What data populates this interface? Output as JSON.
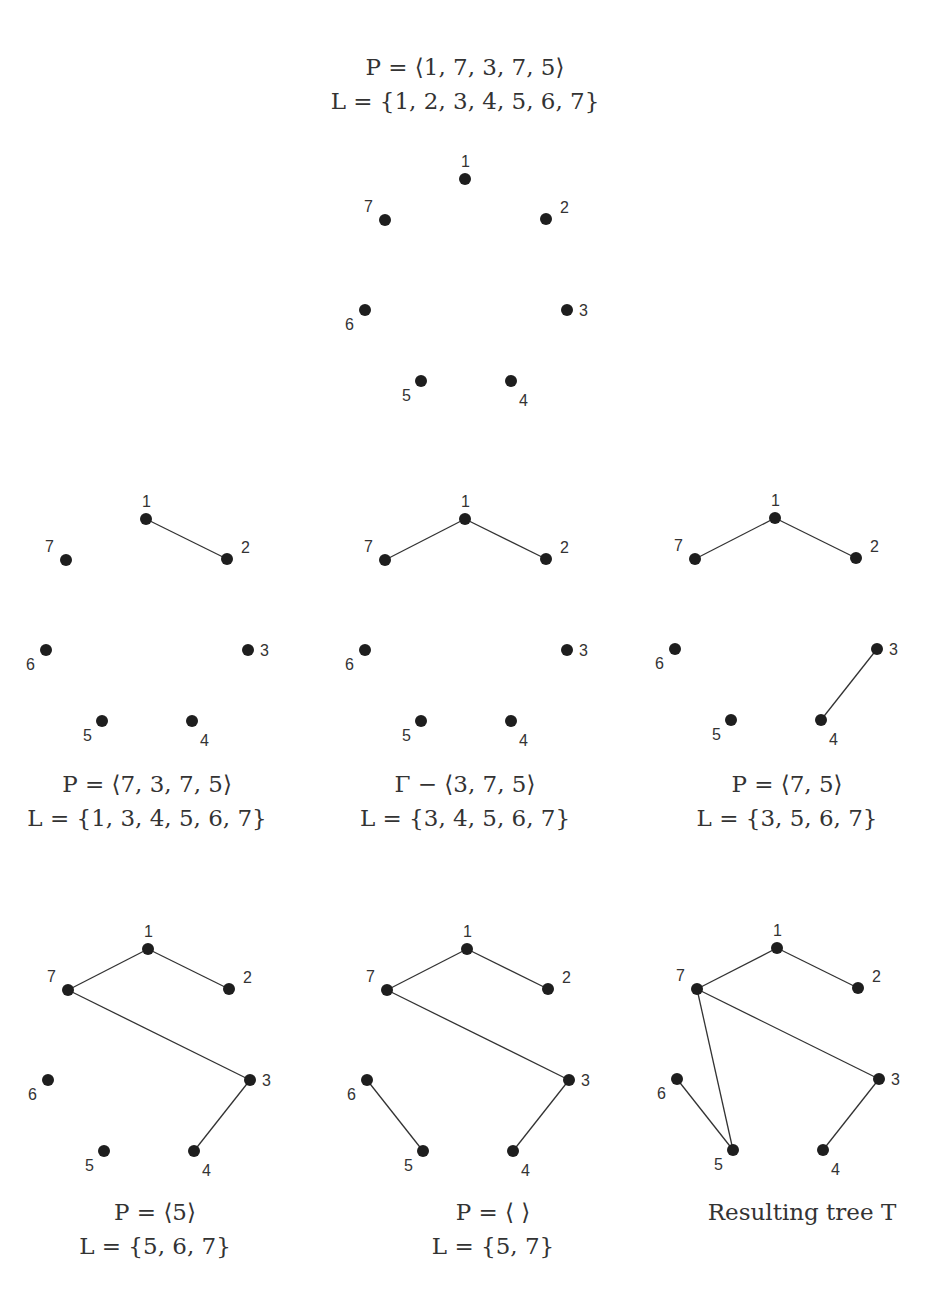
{
  "node_labels": [
    "1",
    "2",
    "3",
    "4",
    "5",
    "6",
    "7"
  ],
  "colors": {
    "node": "#1e1e1e",
    "edge": "#333333",
    "text": "#333333"
  },
  "panels": [
    {
      "id": "initial",
      "edges": [],
      "caption": {
        "line1": "P = ⟨1, 7, 3, 7, 5⟩",
        "line2": "L = {1, 2, 3, 4, 5, 6, 7}",
        "position": "above"
      }
    },
    {
      "id": "step1",
      "edges": [
        [
          1,
          2
        ]
      ],
      "caption": {
        "line1": "P = ⟨7, 3, 7, 5⟩",
        "line2": "L = {1, 3, 4, 5, 6, 7}",
        "position": "below"
      }
    },
    {
      "id": "step2",
      "edges": [
        [
          1,
          2
        ],
        [
          1,
          7
        ]
      ],
      "caption": {
        "line1": "Γ − ⟨3, 7, 5⟩",
        "line2": "L = {3, 4, 5, 6, 7}",
        "position": "below"
      }
    },
    {
      "id": "step3",
      "edges": [
        [
          1,
          2
        ],
        [
          1,
          7
        ],
        [
          3,
          4
        ]
      ],
      "caption": {
        "line1": "P = ⟨7, 5⟩",
        "line2": "L = {3, 5, 6, 7}",
        "position": "below"
      }
    },
    {
      "id": "step4",
      "edges": [
        [
          1,
          2
        ],
        [
          1,
          7
        ],
        [
          3,
          4
        ],
        [
          7,
          3
        ]
      ],
      "caption": {
        "line1": "P = ⟨5⟩",
        "line2": "L = {5, 6, 7}",
        "position": "below"
      }
    },
    {
      "id": "step5",
      "edges": [
        [
          1,
          2
        ],
        [
          1,
          7
        ],
        [
          3,
          4
        ],
        [
          7,
          3
        ],
        [
          6,
          5
        ]
      ],
      "caption": {
        "line1": "P = ⟨ ⟩",
        "line2": "L = {5, 7}",
        "position": "below"
      }
    },
    {
      "id": "result",
      "edges": [
        [
          1,
          2
        ],
        [
          1,
          7
        ],
        [
          3,
          4
        ],
        [
          7,
          3
        ],
        [
          6,
          5
        ],
        [
          7,
          5
        ]
      ],
      "caption": {
        "line1": "Resulting tree T",
        "line2": "",
        "position": "below"
      }
    }
  ]
}
